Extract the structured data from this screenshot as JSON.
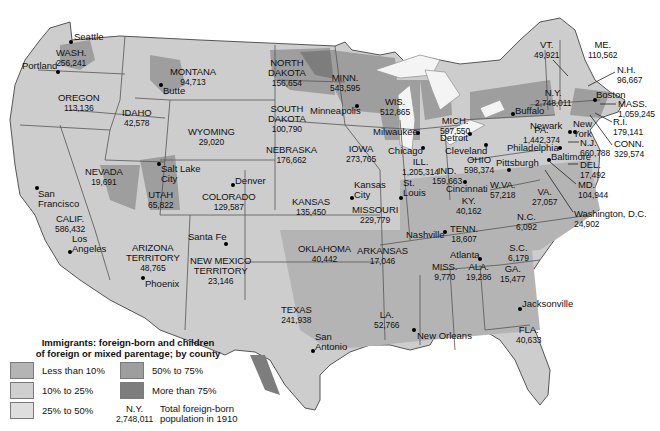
{
  "title": "Immigrants: foreign-born and children of foreign or mixed parentage; by county",
  "legend": {
    "title_line1": "Immigrants: foreign-born and children",
    "title_line2": "of foreign or mixed parentage; by county",
    "items": [
      {
        "label": "Less than 10%",
        "color": "#b4b4b4"
      },
      {
        "label": "10% to 25%",
        "color": "#cfcfcf"
      },
      {
        "label": "25% to 50%",
        "color": "#dedede"
      },
      {
        "label": "50% to 75%",
        "color": "#9e9e9e"
      },
      {
        "label": "More than 75%",
        "color": "#7d7d7d"
      }
    ],
    "example_state": "N.Y.",
    "example_value": "2,748,011",
    "example_desc_line1": "Total foreign-born",
    "example_desc_line2": "population in 1910"
  },
  "colors": {
    "background": "#ffffff",
    "lakes": "#f2f2f2",
    "border": "#555555",
    "less_than_10": "#b4b4b4",
    "p10_25": "#cfcfcf",
    "p25_50": "#dedede",
    "p50_75": "#9e9e9e",
    "more_than_75": "#7d7d7d"
  },
  "states": [
    {
      "name": "WASH.",
      "value": "256,241"
    },
    {
      "name": "OREGON",
      "value": "113,136"
    },
    {
      "name": "IDAHO",
      "value": "42,578"
    },
    {
      "name": "MONTANA",
      "value": "94,713"
    },
    {
      "name": "WYOMING",
      "value": "29,020"
    },
    {
      "name": "NORTH DAKOTA",
      "line1": "NORTH",
      "line2": "DAKOTA",
      "value": "156,654"
    },
    {
      "name": "SOUTH DAKOTA",
      "line1": "SOUTH",
      "line2": "DAKOTA",
      "value": "100,790"
    },
    {
      "name": "MINN.",
      "value": "543,595"
    },
    {
      "name": "WIS.",
      "value": "512,865"
    },
    {
      "name": "MICH.",
      "value": "597,550"
    },
    {
      "name": "IOWA",
      "value": "273,765"
    },
    {
      "name": "NEBRASKA",
      "value": "176,662"
    },
    {
      "name": "NEVADA",
      "value": "19,691"
    },
    {
      "name": "UTAH",
      "value": "65,822"
    },
    {
      "name": "COLORADO",
      "value": "129,587"
    },
    {
      "name": "KANSAS",
      "value": "135,450"
    },
    {
      "name": "CALIF.",
      "value": "586,432"
    },
    {
      "name": "ARIZONA TERRITORY",
      "line1": "ARIZONA",
      "line2": "TERRITORY",
      "value": "48,765"
    },
    {
      "name": "NEW MEXICO TERRITORY",
      "line1": "NEW MEXICO",
      "line2": "TERRITORY",
      "value": "23,146"
    },
    {
      "name": "OKLAHOMA",
      "value": "40,442"
    },
    {
      "name": "TEXAS",
      "value": "241,938"
    },
    {
      "name": "MISSOURI",
      "value": "229,779"
    },
    {
      "name": "ARKANSAS",
      "value": "17,046"
    },
    {
      "name": "LA.",
      "value": "52,766"
    },
    {
      "name": "ILL.",
      "value": "1,205,314"
    },
    {
      "name": "IND.",
      "value": "159,663"
    },
    {
      "name": "OHIO",
      "value": "598,374"
    },
    {
      "name": "KY.",
      "value": "40,162"
    },
    {
      "name": "TENN.",
      "value": "18,607"
    },
    {
      "name": "MISS.",
      "value": "9,770"
    },
    {
      "name": "ALA.",
      "value": "19,286"
    },
    {
      "name": "GA.",
      "value": "15,477"
    },
    {
      "name": "FLA.",
      "value": "40,633"
    },
    {
      "name": "S.C.",
      "value": "6,179"
    },
    {
      "name": "N.C.",
      "value": "6,092"
    },
    {
      "name": "VA.",
      "value": "27,057"
    },
    {
      "name": "W.VA.",
      "value": "57,218"
    },
    {
      "name": "PA.",
      "value": "1,442,374"
    },
    {
      "name": "N.Y.",
      "value": "2,748,011"
    },
    {
      "name": "VT.",
      "value": "49,921"
    },
    {
      "name": "ME.",
      "value": "110,562"
    },
    {
      "name": "N.H.",
      "value": "96,667"
    },
    {
      "name": "MASS.",
      "value": "1,059,245"
    },
    {
      "name": "R.I.",
      "value": "179,141"
    },
    {
      "name": "CONN.",
      "value": "329,574"
    },
    {
      "name": "N.J.",
      "value": "660,788"
    },
    {
      "name": "DEL.",
      "value": "17,492"
    },
    {
      "name": "MD.",
      "value": "104,944"
    },
    {
      "name": "Washington, D.C.",
      "value": "24,902"
    }
  ],
  "cities": [
    "Seattle",
    "Portland",
    "Butte",
    "San Francisco",
    "Los Angeles",
    "Salt Lake City",
    "Denver",
    "Santa Fe",
    "Phoenix",
    "Minneapolis",
    "Milwaukee",
    "Chicago",
    "Kansas City",
    "St. Louis",
    "Detroit",
    "Cleveland",
    "Cincinnati",
    "Buffalo",
    "Pittsburgh",
    "Philadelphia",
    "Newark",
    "New York",
    "Boston",
    "Baltimore",
    "Nashville",
    "Atlanta",
    "New Orleans",
    "Jacksonville",
    "San Antonio"
  ],
  "city_labels": {
    "san_1": "San",
    "san_2": "Francisco",
    "los_1": "Los",
    "los_2": "Angeles",
    "slc_1": "Salt Lake",
    "slc_2": "City",
    "kc_1": "Kansas",
    "kc_2": "City",
    "stl_1": "St.",
    "stl_2": "Louis",
    "ny_1": "New",
    "ny_2": "York",
    "sa_1": "San",
    "sa_2": "Antonio"
  }
}
